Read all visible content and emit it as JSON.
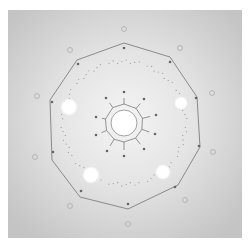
{
  "figure": {
    "type": "diffraction-pattern",
    "symmetry": "10-fold",
    "colors": {
      "background_outer": "#c9c9c9",
      "background_inner": "#f2f2f2",
      "outline": "#8a8a8a",
      "dot": "#666666",
      "bright_spot": "#ffffff",
      "ring_marks": "#9a9a9a"
    },
    "frame": {
      "x": 8,
      "y": 10,
      "width": 234,
      "height": 228
    },
    "center": {
      "x": 124,
      "y": 123,
      "bright_radius": 13
    },
    "decagon_vertices": [
      [
        124,
        43
      ],
      [
        170,
        57
      ],
      [
        197,
        97
      ],
      [
        200,
        147
      ],
      [
        178,
        185
      ],
      [
        128,
        209
      ],
      [
        80,
        197
      ],
      [
        52,
        160
      ],
      [
        50,
        100
      ],
      [
        77,
        60
      ]
    ],
    "outer_dots": [
      [
        124,
        48
      ],
      [
        170,
        62
      ],
      [
        196,
        98
      ],
      [
        199,
        146
      ],
      [
        175,
        187
      ],
      [
        128,
        204
      ],
      [
        81,
        191
      ],
      [
        53,
        152
      ],
      [
        52,
        102
      ],
      [
        78,
        64
      ]
    ],
    "inner_dots": [
      [
        124,
        92
      ],
      [
        144,
        99
      ],
      [
        156,
        115
      ],
      [
        155,
        134
      ],
      [
        144,
        149
      ],
      [
        124,
        156
      ],
      [
        107,
        151
      ],
      [
        96,
        135
      ],
      [
        96,
        117
      ],
      [
        106,
        98
      ]
    ],
    "inner_ring_radius": 19,
    "bright_spots": [
      {
        "x": 69,
        "y": 107,
        "r": 7
      },
      {
        "x": 91,
        "y": 175,
        "r": 7
      },
      {
        "x": 163,
        "y": 172,
        "r": 6
      },
      {
        "x": 181,
        "y": 103,
        "r": 5
      }
    ],
    "faint_circles": [
      [
        124,
        29
      ],
      [
        70,
        50
      ],
      [
        180,
        48
      ],
      [
        212,
        93
      ],
      [
        213,
        152
      ],
      [
        185,
        200
      ],
      [
        128,
        224
      ],
      [
        70,
        206
      ],
      [
        35,
        157
      ],
      [
        37,
        96
      ]
    ],
    "dotted_ring_radius": 60
  }
}
